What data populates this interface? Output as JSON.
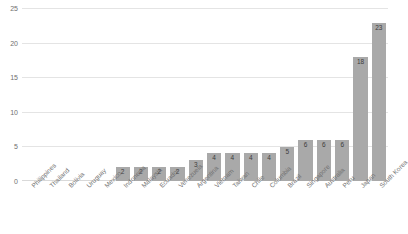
{
  "chart_data": {
    "type": "bar",
    "title": "",
    "xlabel": "",
    "ylabel": "",
    "ylim": [
      0,
      25
    ],
    "yticks": [
      0,
      5,
      10,
      15,
      20,
      25
    ],
    "grid": true,
    "legend": "none",
    "bar_color": "#a9a9a9",
    "label_rotation": -45,
    "categories": [
      "Philippines",
      "Thailand",
      "Bolivia",
      "Uruguay",
      "Mexico",
      "Indonesia",
      "Malaysia",
      "Ecuador",
      "Venezuela",
      "Argentina",
      "Vietnam",
      "Taiwan",
      "Chile",
      "Columbia",
      "Brazil",
      "Singapore",
      "Australia",
      "Peru",
      "Japan",
      "South Korea"
    ],
    "values": [
      0,
      0,
      0,
      0,
      0,
      2,
      2,
      2,
      2,
      3,
      4,
      4,
      4,
      4,
      5,
      6,
      6,
      6,
      18,
      23
    ],
    "value_labels": [
      "",
      "",
      "",
      "",
      "",
      "2",
      "2",
      "2",
      "2",
      "3",
      "4",
      "4",
      "4",
      "4",
      "5",
      "6",
      "6",
      "6",
      "18",
      "23"
    ]
  }
}
